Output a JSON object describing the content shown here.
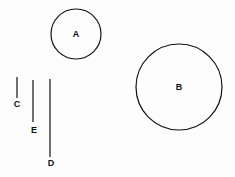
{
  "shapes": {
    "circles": [
      {
        "label": "A",
        "cx": 76,
        "cy": 34,
        "r": 25
      },
      {
        "label": "B",
        "cx": 179,
        "cy": 87,
        "r": 43
      }
    ],
    "lines": [
      {
        "label": "C",
        "x": 17,
        "y1": 77,
        "y2": 98,
        "lx": 17,
        "ly": 104
      },
      {
        "label": "E",
        "x": 33,
        "y1": 80,
        "y2": 122,
        "lx": 34,
        "ly": 130
      },
      {
        "label": "D",
        "x": 50,
        "y1": 79,
        "y2": 157,
        "lx": 51,
        "ly": 163
      }
    ]
  },
  "colors": {
    "stroke": "#111111",
    "background": "#fdfdfd"
  }
}
